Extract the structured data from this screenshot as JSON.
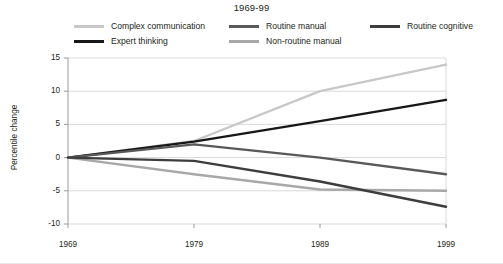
{
  "chart_data": {
    "type": "line",
    "title": "1969-99",
    "xlabel": "",
    "ylabel": "Percentile change",
    "x": [
      "1969",
      "1979",
      "1989",
      "1999"
    ],
    "categories": [
      "1969",
      "1979",
      "1989",
      "1999"
    ],
    "xlim": [
      1969,
      1999
    ],
    "ylim": [
      -10,
      15
    ],
    "yticks": [
      "15",
      "10",
      "5",
      "0",
      "-5",
      "-10"
    ],
    "ytick_values": [
      15,
      10,
      5,
      0,
      -5,
      -10
    ],
    "grid": true,
    "legend_position": "top",
    "series": [
      {
        "name": "Complex communication",
        "color": "#c8c8c8",
        "values": [
          0,
          2.5,
          10.0,
          14.0
        ]
      },
      {
        "name": "Expert thinking",
        "color": "#171717",
        "values": [
          0,
          2.4,
          5.5,
          8.7
        ]
      },
      {
        "name": "Routine manual",
        "color": "#595959",
        "values": [
          0,
          2.0,
          0.0,
          -2.5
        ]
      },
      {
        "name": "Non-routine manual",
        "color": "#a8a8a8",
        "values": [
          0,
          -2.5,
          -4.8,
          -5.0
        ]
      },
      {
        "name": "Routine cognitive",
        "color": "#3d3d3d",
        "values": [
          0,
          -0.5,
          -3.6,
          -7.4
        ]
      }
    ]
  },
  "legend": {
    "items": [
      {
        "label": "Complex communication",
        "color": "#c8c8c8",
        "row": 0,
        "col": 0
      },
      {
        "label": "Routine manual",
        "color": "#595959",
        "row": 0,
        "col": 1
      },
      {
        "label": "Routine cognitive",
        "color": "#3d3d3d",
        "row": 0,
        "col": 2
      },
      {
        "label": "Expert thinking",
        "color": "#171717",
        "row": 1,
        "col": 0
      },
      {
        "label": "Non-routine manual",
        "color": "#a8a8a8",
        "row": 1,
        "col": 1
      }
    ]
  },
  "axes": {
    "y_title": "Percentile change",
    "y_ticks": [
      "15",
      "10",
      "5",
      "0",
      "-5",
      "-10"
    ],
    "x_ticks": [
      "1969",
      "1979",
      "1989",
      "1999"
    ]
  },
  "colors": {
    "grid": "#d9d9d9",
    "axis": "#9a9a9a",
    "text": "#231f20",
    "background": "#ffffff"
  }
}
